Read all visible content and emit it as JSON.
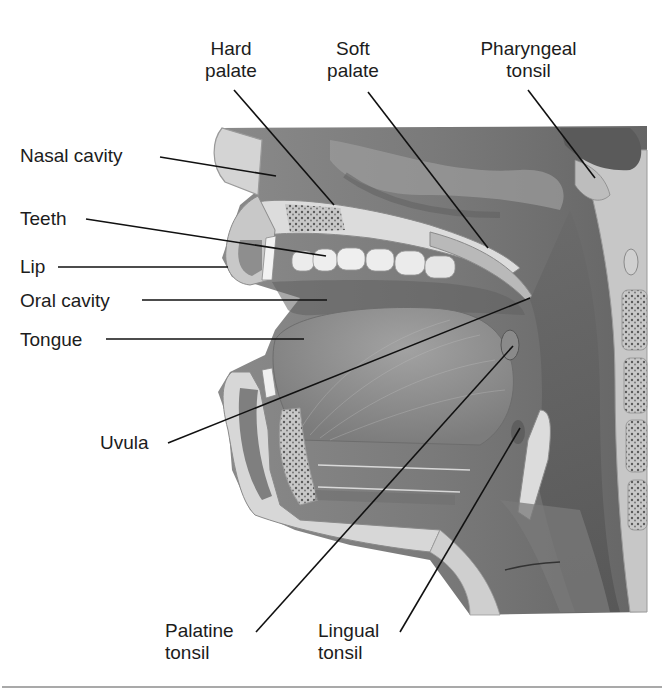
{
  "figure": {
    "colors": {
      "background": "#ffffff",
      "cavity_dark": "#6e6e6e",
      "cavity_mid": "#9a9a9a",
      "tissue_light": "#d6d6d6",
      "bone_spongy": "#bdbdbd",
      "tongue": "#8f8f8f",
      "teeth": "#ececec",
      "leader_line": "#111111",
      "separator": "#a9a9a9"
    }
  },
  "labels": [
    {
      "id": "hard-palate",
      "lines": [
        "Hard",
        "palate"
      ],
      "x": 196,
      "y": 38,
      "w": 70,
      "align": "center",
      "leader": [
        [
          234,
          90
        ],
        [
          334,
          205
        ]
      ]
    },
    {
      "id": "soft-palate",
      "lines": [
        "Soft",
        "palate"
      ],
      "x": 318,
      "y": 38,
      "w": 70,
      "align": "center",
      "leader": [
        [
          368,
          92
        ],
        [
          488,
          248
        ]
      ]
    },
    {
      "id": "pharyngeal-tonsil",
      "lines": [
        "Pharyngeal",
        "tonsil"
      ],
      "x": 466,
      "y": 38,
      "w": 125,
      "align": "center",
      "leader": [
        [
          528,
          90
        ],
        [
          595,
          178
        ]
      ]
    },
    {
      "id": "nasal-cavity",
      "lines": [
        "Nasal cavity"
      ],
      "x": 20,
      "y": 145,
      "w": 140,
      "align": "left",
      "leader": [
        [
          160,
          157
        ],
        [
          276,
          176
        ]
      ]
    },
    {
      "id": "teeth",
      "lines": [
        "Teeth"
      ],
      "x": 20,
      "y": 208,
      "w": 70,
      "align": "left",
      "leader": [
        [
          86,
          219
        ],
        [
          326,
          256
        ]
      ]
    },
    {
      "id": "lip",
      "lines": [
        "Lip"
      ],
      "x": 20,
      "y": 256,
      "w": 40,
      "align": "left",
      "leader": [
        [
          58,
          267
        ],
        [
          228,
          267
        ]
      ]
    },
    {
      "id": "oral-cavity",
      "lines": [
        "Oral cavity"
      ],
      "x": 20,
      "y": 290,
      "w": 125,
      "align": "left",
      "leader": [
        [
          142,
          300
        ],
        [
          327,
          300
        ]
      ]
    },
    {
      "id": "tongue",
      "lines": [
        "Tongue"
      ],
      "x": 20,
      "y": 329,
      "w": 85,
      "align": "left",
      "leader": [
        [
          106,
          339
        ],
        [
          304,
          339
        ]
      ]
    },
    {
      "id": "uvula",
      "lines": [
        "Uvula"
      ],
      "x": 100,
      "y": 432,
      "w": 65,
      "align": "left",
      "leader": [
        [
          168,
          443
        ],
        [
          530,
          298
        ]
      ]
    },
    {
      "id": "palatine-tonsil",
      "lines": [
        "Palatine",
        "tonsil"
      ],
      "x": 165,
      "y": 620,
      "w": 90,
      "align": "left",
      "leader": [
        [
          256,
          632
        ],
        [
          513,
          346
        ]
      ]
    },
    {
      "id": "lingual-tonsil",
      "lines": [
        "Lingual",
        "tonsil"
      ],
      "x": 318,
      "y": 620,
      "w": 85,
      "align": "left",
      "leader": [
        [
          400,
          632
        ],
        [
          520,
          428
        ]
      ]
    }
  ]
}
